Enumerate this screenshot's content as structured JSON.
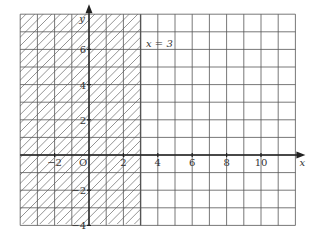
{
  "graph": {
    "x_axis_label": "x",
    "y_axis_label": "y",
    "origin_label": "O",
    "x_ticks": [
      {
        "value": -2,
        "label": "−2"
      },
      {
        "value": 2,
        "label": "2"
      },
      {
        "value": 4,
        "label": "4"
      },
      {
        "value": 6,
        "label": "6"
      },
      {
        "value": 8,
        "label": "8"
      },
      {
        "value": 10,
        "label": "10"
      }
    ],
    "y_ticks": [
      {
        "value": 6,
        "label": "6"
      },
      {
        "value": 4,
        "label": "4"
      },
      {
        "value": 2,
        "label": "2"
      },
      {
        "value": -2,
        "label": "−2"
      },
      {
        "value": -4,
        "label": "−4"
      }
    ],
    "line_label": "x = 3",
    "x_range": [
      -4,
      12
    ],
    "y_range": [
      -4,
      8
    ],
    "shaded_region": "x ≤ 3 (hatched)",
    "colors": {
      "grid": "#555555",
      "axis": "#222222",
      "hatch": "#666666",
      "background": "#ffffff"
    }
  }
}
